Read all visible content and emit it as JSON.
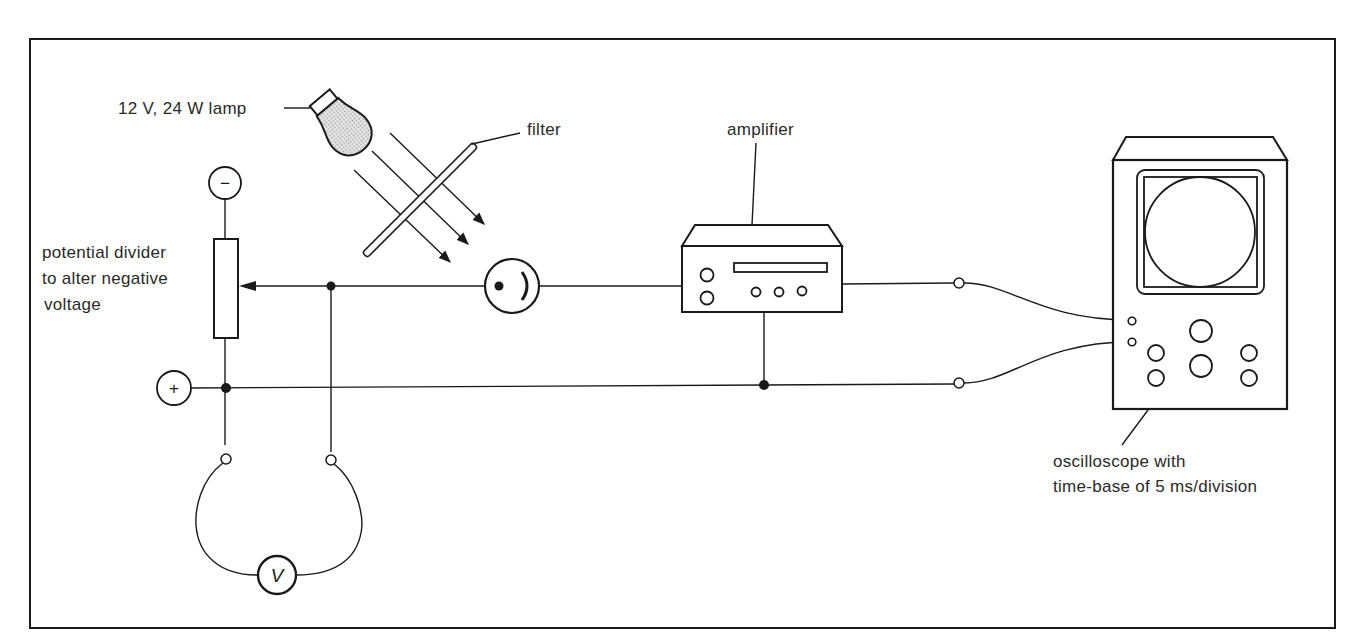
{
  "diagram": {
    "labels": {
      "lamp": "12 V, 24 W lamp",
      "filter": "filter",
      "amplifier": "amplifier",
      "divider_line1": "potential divider",
      "divider_line2": "to alter negative",
      "divider_line3": "voltage",
      "scope_line1": "oscilloscope with",
      "scope_line2": "time-base of 5 ms/division"
    },
    "symbols": {
      "negative_terminal": "−",
      "positive_terminal": "+",
      "voltmeter": "V"
    },
    "components": [
      "lamp",
      "filter",
      "light-rays",
      "photocell",
      "potential-divider",
      "voltmeter",
      "amplifier",
      "oscilloscope"
    ],
    "colors": {
      "ink": "#1a1a1a",
      "background": "#ffffff",
      "lamp_fill": "#c8c8c8"
    }
  }
}
